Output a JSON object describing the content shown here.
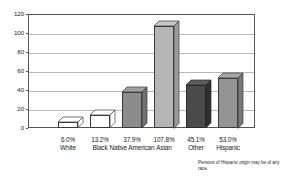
{
  "chart_data": {
    "type": "bar",
    "title": "",
    "xlabel": "",
    "ylabel": "",
    "ylim": [
      0,
      120
    ],
    "ytick_values": [
      0,
      20,
      40,
      60,
      80,
      100,
      120
    ],
    "ytick_labels": [
      "0",
      "20",
      "40",
      "60",
      "80",
      "100",
      "120"
    ],
    "grid": true,
    "legend": "none",
    "categories": [
      "White",
      "Black",
      "Native American",
      "Asian",
      "Other",
      "Hispanic"
    ],
    "values": [
      6.0,
      13.2,
      37.9,
      107.8,
      45.1,
      53.0
    ],
    "value_labels": [
      "6.0%",
      "13.2%",
      "37.9%",
      "107.8%",
      "45.1%",
      "53.0%"
    ],
    "bars": [
      {
        "label": "White",
        "value_label": "6.0%",
        "value": 6.0,
        "fill": "#ffffff",
        "top_fill": "#ffffff",
        "side_fill": "#ffffff",
        "stroke": "#3a3a3a",
        "left": 30,
        "width": 20
      },
      {
        "label": "Black",
        "value_label": "13.2%",
        "value": 13.2,
        "fill": "#ffffff",
        "top_fill": "#ffffff",
        "side_fill": "#ffffff",
        "stroke": "#3a3a3a",
        "left": 62,
        "width": 20
      },
      {
        "label": "Native American",
        "value_label": "37.9%",
        "value": 37.9,
        "fill": "#8c8c8c",
        "top_fill": "#9e9e9e",
        "side_fill": "#707070",
        "stroke": "#3a3a3a",
        "left": 94,
        "width": 20
      },
      {
        "label": "Asian",
        "value_label": "107.8%",
        "value": 107.8,
        "fill": "#b5b5b5",
        "top_fill": "#c7c7c7",
        "side_fill": "#9a9a9a",
        "stroke": "#3a3a3a",
        "left": 126,
        "width": 20
      },
      {
        "label": "Other",
        "value_label": "45.1%",
        "value": 45.1,
        "fill": "#4a4a4a",
        "top_fill": "#5c5c5c",
        "side_fill": "#303030",
        "stroke": "#2a2a2a",
        "left": 158,
        "width": 20
      },
      {
        "label": "Hispanic",
        "value_label": "53.0%",
        "value": 53.0,
        "fill": "#949494",
        "top_fill": "#a6a6a6",
        "side_fill": "#787878",
        "stroke": "#3a3a3a",
        "left": 190,
        "width": 20
      }
    ],
    "footnote": "Persons of Hispanic origin may be of any race.",
    "colors": {
      "axis": "#555555",
      "grid": "#b9b9b9",
      "text": "#1a1a1a",
      "background": "#ffffff"
    }
  }
}
